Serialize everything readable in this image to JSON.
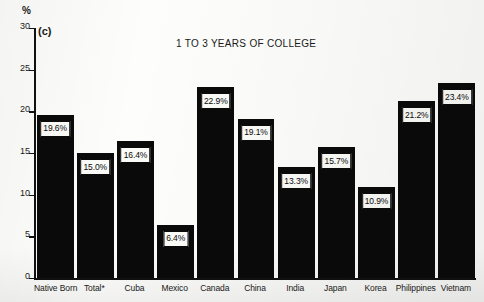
{
  "figure": {
    "panel_letter": "(c)",
    "y_axis_unit": "%"
  },
  "chart_data": {
    "type": "bar",
    "title": "1 TO 3 YEARS OF COLLEGE",
    "xlabel": "",
    "ylabel": "%",
    "ylim": [
      0,
      30
    ],
    "yticks": [
      0,
      5,
      10,
      15,
      20,
      25,
      30
    ],
    "ytick_labels": [
      "0",
      "5",
      "10",
      "15",
      "20",
      "25",
      "30"
    ],
    "grid": false,
    "legend": null,
    "categories": [
      "Native Born",
      "Total*",
      "Cuba",
      "Mexico",
      "Canada",
      "China",
      "India",
      "Japan",
      "Korea",
      "Philippines",
      "Vietnam"
    ],
    "values": [
      19.6,
      15.0,
      16.4,
      6.4,
      22.9,
      19.1,
      13.3,
      15.7,
      10.9,
      21.2,
      23.4
    ],
    "value_labels": [
      "19.6%",
      "15.0%",
      "16.4%",
      "6.4%",
      "22.9%",
      "19.1%",
      "13.3%",
      "15.7%",
      "10.9%",
      "21.2%",
      "23.4%"
    ],
    "bar_color": "#0a0a0a",
    "label_box_background": "#fbfbf8",
    "label_box_border": "#0a0a0a"
  }
}
